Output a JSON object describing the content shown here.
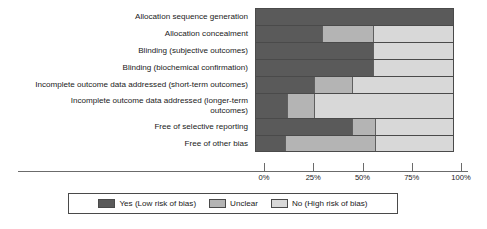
{
  "chart_data": {
    "type": "bar",
    "orientation": "horizontal",
    "stacked": true,
    "stack_total": 100,
    "title": "",
    "subtitle": "",
    "xlabel": "",
    "ylabel": "",
    "xlim": [
      0,
      100
    ],
    "grid": false,
    "legend_position": "bottom",
    "x_ticks": [
      0,
      25,
      50,
      75,
      100
    ],
    "x_tick_labels": [
      "0%",
      "25%",
      "50%",
      "75%",
      "100%"
    ],
    "categories": [
      "Allocation sequence generation",
      "Allocation concealment",
      "Blinding (subjective outcomes)",
      "Blinding (biochemical confirmation)",
      "Incomplete outcome data addressed (short-term outcomes)",
      "Incomplete outcome data addressed (longer-term outcomes)",
      "Free of selective reporting",
      "Free of other bias"
    ],
    "category_lines": [
      [
        "Allocation sequence generation"
      ],
      [
        "Allocation concealment"
      ],
      [
        "Blinding (subjective outcomes)"
      ],
      [
        "Blinding (biochemical confirmation)"
      ],
      [
        "Incomplete outcome data addressed (short-term outcomes)"
      ],
      [
        "Incomplete outcome data addressed (longer-term",
        "outcomes)"
      ],
      [
        "Free of selective reporting"
      ],
      [
        "Free of other bias"
      ]
    ],
    "series": [
      {
        "name": "Yes (Low risk of bias)",
        "color": "#5a5a5a",
        "values": [
          100,
          34,
          60,
          60,
          30,
          16,
          49,
          15
        ]
      },
      {
        "name": "Unclear",
        "color": "#b4b4b4",
        "values": [
          0,
          26,
          0,
          0,
          19,
          14,
          12,
          46
        ]
      },
      {
        "name": "No (High risk of bias)",
        "color": "#d8d8d8",
        "values": [
          0,
          40,
          40,
          40,
          51,
          70,
          39,
          39
        ]
      }
    ]
  },
  "legend": {
    "items": [
      {
        "label": "Yes (Low risk of bias)",
        "swatch": "yes"
      },
      {
        "label": "Unclear",
        "swatch": "unclear"
      },
      {
        "label": "No (High risk of bias)",
        "swatch": "no"
      }
    ]
  },
  "colors": {
    "yes": "#5a5a5a",
    "unclear": "#b4b4b4",
    "no": "#d8d8d8",
    "outline": "#4a4a4a",
    "axis": "#6b6b6b",
    "text": "#1a1a1a",
    "background": "#ffffff"
  }
}
